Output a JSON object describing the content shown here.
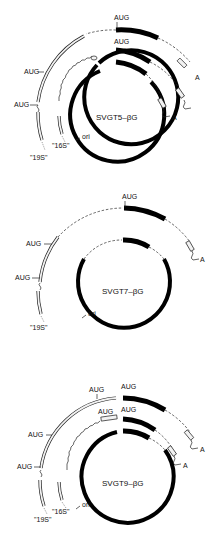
{
  "header": {
    "corner_text": ""
  },
  "diagrams": [
    {
      "name": "SVGT5-βG",
      "label": "SVGT5–βG",
      "ori_label": "ori",
      "labels": {
        "aug_top_1": "AUG",
        "aug_top_2": "AUG",
        "aug_left_1": "AUG",
        "aug_left_2": "AUG",
        "poly_a_1": "A",
        "poly_a_2": "A",
        "rna_16s": "\"16S\"",
        "rna_19s": "\"19S\""
      }
    },
    {
      "name": "SVGT7-βG",
      "label": "SVGT7–βG",
      "ori_label": "ori",
      "labels": {
        "aug_top_1": "AUG",
        "aug_left_1": "AUG",
        "aug_left_2": "AUG",
        "poly_a_1": "A",
        "rna_19s": "\"19S\""
      }
    },
    {
      "name": "SVGT9-βG",
      "label": "SVGT9–βG",
      "ori_label": "ori",
      "labels": {
        "aug_top_1": "AUG",
        "aug_top_1b": "AUG",
        "aug_top_2": "AUG",
        "aug_top_2b": "AUG",
        "aug_left_1": "AUG",
        "aug_left_2": "AUG",
        "poly_a_1": "A",
        "poly_a_2": "A",
        "rna_16s": "\"16S\"",
        "rna_19s": "\"19S\""
      }
    }
  ],
  "colors": {
    "ink": "#000000",
    "background": "#ffffff",
    "box_fill": "#f2f2f2"
  }
}
